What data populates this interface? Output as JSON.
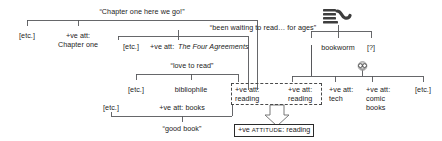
{
  "diagram": {
    "type": "discourse-attitude-tree",
    "final_node": {
      "prefix": "+ve ",
      "keyword": "ATTITUDE",
      "suffix": ": reading"
    },
    "nodes": [
      {
        "id": "n1",
        "text": "“Chapter one here we go!”",
        "x": 142,
        "y": 10,
        "align": "center"
      },
      {
        "id": "n2",
        "text": "[etc.]",
        "x": 27,
        "y": 34,
        "align": "center"
      },
      {
        "id": "n3a",
        "text": "+ve att:",
        "x": 78,
        "y": 34,
        "align": "center"
      },
      {
        "id": "n3b",
        "text": "Chapter one",
        "x": 78,
        "y": 43,
        "align": "center"
      },
      {
        "id": "n4",
        "text": "“been waiting to read… for ages”",
        "x": 263,
        "y": 26,
        "align": "center"
      },
      {
        "id": "n5",
        "text": "[etc.]",
        "x": 131,
        "y": 45,
        "align": "center"
      },
      {
        "id": "n6",
        "text": "+ve att: ",
        "x": 163,
        "y": 45,
        "align": "left"
      },
      {
        "id": "n7",
        "text": "The Four Agreements",
        "x": 191,
        "y": 45,
        "align": "left",
        "style": "italic"
      },
      {
        "id": "n8",
        "text": "“love to read”",
        "x": 192,
        "y": 64,
        "align": "center"
      },
      {
        "id": "n9",
        "text": "[etc.]",
        "x": 136,
        "y": 88,
        "align": "center"
      },
      {
        "id": "n10",
        "text": "bibliophile",
        "x": 191,
        "y": 88,
        "align": "center"
      },
      {
        "id": "n11a",
        "text": "+ve att:",
        "x": 236,
        "y": 88,
        "align": "left"
      },
      {
        "id": "n11b",
        "text": "reading",
        "x": 236,
        "y": 97,
        "align": "left"
      },
      {
        "id": "n12a",
        "text": "+ve att:",
        "x": 290,
        "y": 88,
        "align": "left"
      },
      {
        "id": "n12b",
        "text": "reading",
        "x": 290,
        "y": 97,
        "align": "left"
      },
      {
        "id": "n13a",
        "text": "+ve att:",
        "x": 332,
        "y": 88,
        "align": "left"
      },
      {
        "id": "n13b",
        "text": "tech",
        "x": 332,
        "y": 97,
        "align": "left"
      },
      {
        "id": "n14a",
        "text": "+ve att:",
        "x": 369,
        "y": 88,
        "align": "left"
      },
      {
        "id": "n14b",
        "text": "comic",
        "x": 369,
        "y": 97,
        "align": "left"
      },
      {
        "id": "n14c",
        "text": "books",
        "x": 369,
        "y": 106,
        "align": "left"
      },
      {
        "id": "n15",
        "text": "[etc.]",
        "x": 423,
        "y": 88,
        "align": "center"
      },
      {
        "id": "n16",
        "text": "[etc.]",
        "x": 111,
        "y": 106,
        "align": "center"
      },
      {
        "id": "n17",
        "text": "+ve att: books",
        "x": 182,
        "y": 106,
        "align": "center"
      },
      {
        "id": "n18",
        "text": "“good book”",
        "x": 182,
        "y": 127,
        "align": "center"
      },
      {
        "id": "n19",
        "text": "bookworm",
        "x": 338,
        "y": 46,
        "align": "center"
      },
      {
        "id": "n20",
        "text": "[?]",
        "x": 371,
        "y": 46,
        "align": "center"
      }
    ],
    "icons": [
      {
        "id": "books-worm-icon",
        "name": "stacked-books-worm-icon",
        "x": 322,
        "y": 7,
        "w": 30,
        "h": 17
      },
      {
        "id": "nerd-face-icon",
        "name": "nerd-face-emoji-icon",
        "x": 356,
        "y": 58,
        "w": 13,
        "h": 11
      }
    ],
    "grouping": {
      "dashed_box": {
        "x": 231,
        "y": 83,
        "w": 91,
        "h": 22
      },
      "arrow": {
        "label": "down-arrow"
      }
    }
  }
}
